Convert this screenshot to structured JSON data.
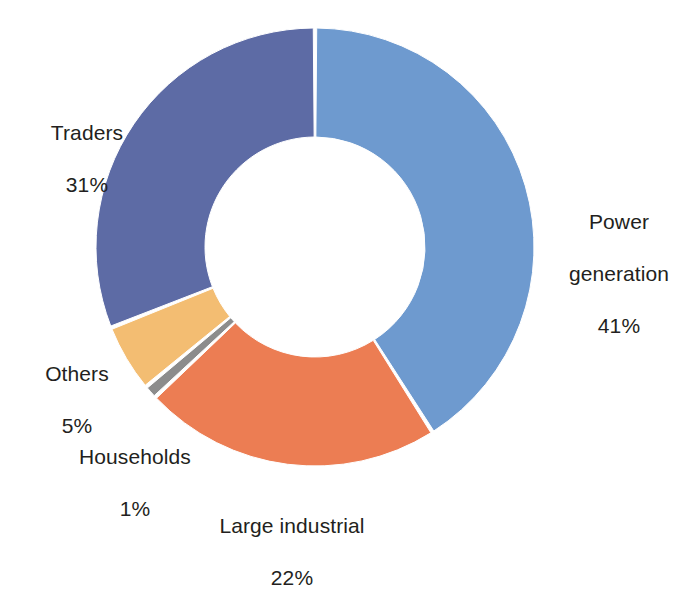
{
  "chart_data": {
    "type": "pie",
    "variant": "donut",
    "title": "",
    "subtitle": "",
    "xlabel": "",
    "ylabel": "",
    "grid": false,
    "legend_position": "none",
    "units": "%",
    "start_angle_deg": 0,
    "direction": "clockwise",
    "categories": [
      "Power generation",
      "Large industrial",
      "Households",
      "Others",
      "Traders"
    ],
    "values": [
      41,
      22,
      1,
      5,
      31
    ],
    "value_labels": [
      "41%",
      "22%",
      "1%",
      "5%",
      "31%"
    ],
    "colors": [
      "#6e9acf",
      "#ec7d53",
      "#8c8c8c",
      "#f3bd72",
      "#5d6ba5"
    ],
    "slices": [
      {
        "name": "Power generation",
        "label_line1": "Power",
        "label_line2": "generation",
        "value": 41,
        "value_label": "41%",
        "color": "#6e9acf",
        "start_deg": 0,
        "end_deg": 147.6
      },
      {
        "name": "Large industrial",
        "label_line1": "Large industrial",
        "label_line2": "",
        "value": 22,
        "value_label": "22%",
        "color": "#ec7d53",
        "start_deg": 147.6,
        "end_deg": 226.8
      },
      {
        "name": "Households",
        "label_line1": "Households",
        "label_line2": "",
        "value": 1,
        "value_label": "1%",
        "color": "#8c8c8c",
        "start_deg": 226.8,
        "end_deg": 230.4
      },
      {
        "name": "Others",
        "label_line1": "Others",
        "label_line2": "",
        "value": 5,
        "value_label": "5%",
        "color": "#f3bd72",
        "start_deg": 230.4,
        "end_deg": 248.4
      },
      {
        "name": "Traders",
        "label_line1": "Traders",
        "label_line2": "",
        "value": 31,
        "value_label": "31%",
        "color": "#5d6ba5",
        "start_deg": 248.4,
        "end_deg": 360
      }
    ],
    "geometry": {
      "center_x": 315,
      "center_y": 247,
      "outer_radius": 219,
      "inner_radius": 110,
      "gap_degrees": 0.9,
      "background": "#ffffff"
    }
  },
  "labels": {
    "traders": {
      "name": "Traders",
      "value_label": "31%"
    },
    "power_generation": {
      "line1": "Power",
      "line2": "generation",
      "value_label": "41%"
    },
    "others": {
      "name": "Others",
      "value_label": "5%"
    },
    "households": {
      "name": "Households",
      "value_label": "1%"
    },
    "large_industrial": {
      "name": "Large industrial",
      "value_label": "22%"
    }
  }
}
